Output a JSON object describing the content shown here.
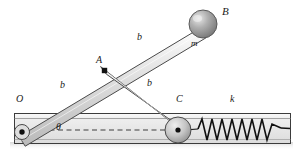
{
  "figure": {
    "type": "mechanism-diagram",
    "background_color": "#ffffff",
    "bar_fill_color": "#d6d6d6",
    "bar_edge_color": "#4a4a4a",
    "ball_color": "#9a9a9a",
    "channel_fill_color": "#f0f0f0",
    "channel_edge_color": "#3c3c3c",
    "spring_color": "#111111",
    "dash_color": "#444444",
    "joint_color": "#111111"
  },
  "labels": {
    "point_O": "O",
    "point_A": "A",
    "point_B": "B",
    "point_C": "C",
    "mass": "m",
    "spring_constant": "k",
    "angle": "θ",
    "length_OA": "b",
    "length_AB": "b",
    "length_AC": "b"
  },
  "geometry": {
    "pivot_O": [
      22,
      132
    ],
    "joint_A": [
      105,
      71
    ],
    "ball_B": [
      203,
      24
    ],
    "slider_C": [
      178,
      130
    ],
    "ball_radius": 14,
    "slider_radius": 13,
    "channel": {
      "x": 14,
      "y": 113,
      "width": 277,
      "height": 31
    },
    "centerline_y": 130,
    "spring": {
      "x_start": 197,
      "x_end": 283,
      "coils": 9,
      "amplitude": 11
    }
  }
}
